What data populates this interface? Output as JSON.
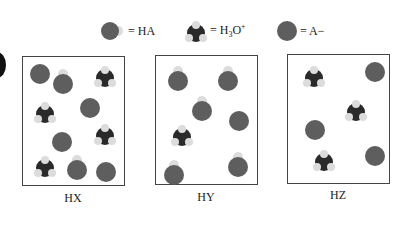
{
  "legend": [
    {
      "id": "ha",
      "icon": "ha-molecule-icon",
      "label": "= HA"
    },
    {
      "id": "h3o",
      "icon": "hydronium-molecule-icon",
      "label_parts": [
        "= H",
        "3",
        "O",
        "+"
      ]
    },
    {
      "id": "a",
      "icon": "anion-molecule-icon",
      "label": "= A−"
    }
  ],
  "colors": {
    "anion_sphere": "#5e5e5e",
    "hydrogen_sphere": "#dcdcdc",
    "oxygen_dark": "#2a2a2a",
    "box_border": "#444444"
  },
  "boxes": [
    {
      "label": "HX",
      "counts": {
        "HA": 2,
        "H3O+": 4,
        "A-": 4
      },
      "molecules": [
        {
          "type": "A",
          "x": 6,
          "y": 6
        },
        {
          "type": "HA",
          "x": 28,
          "y": 12
        },
        {
          "type": "H3O",
          "x": 70,
          "y": 8
        },
        {
          "type": "H3O",
          "x": 10,
          "y": 44
        },
        {
          "type": "A",
          "x": 56,
          "y": 40
        },
        {
          "type": "A",
          "x": 28,
          "y": 74
        },
        {
          "type": "H3O",
          "x": 70,
          "y": 66
        },
        {
          "type": "H3O",
          "x": 10,
          "y": 98
        },
        {
          "type": "HA",
          "x": 42,
          "y": 98
        },
        {
          "type": "A",
          "x": 72,
          "y": 104
        }
      ]
    },
    {
      "label": "HY",
      "counts": {
        "HA": 5,
        "H3O+": 1,
        "A-": 1
      },
      "molecules": [
        {
          "type": "HA",
          "x": 10,
          "y": 10
        },
        {
          "type": "HA",
          "x": 60,
          "y": 10
        },
        {
          "type": "HA",
          "x": 34,
          "y": 40
        },
        {
          "type": "A",
          "x": 72,
          "y": 54
        },
        {
          "type": "H3O",
          "x": 14,
          "y": 68
        },
        {
          "type": "HA",
          "x": 6,
          "y": 104
        },
        {
          "type": "HA",
          "x": 70,
          "y": 96
        }
      ]
    },
    {
      "label": "HZ",
      "counts": {
        "HA": 0,
        "H3O+": 3,
        "A-": 3
      },
      "molecules": [
        {
          "type": "H3O",
          "x": 14,
          "y": 10
        },
        {
          "type": "A",
          "x": 76,
          "y": 6
        },
        {
          "type": "H3O",
          "x": 56,
          "y": 44
        },
        {
          "type": "A",
          "x": 16,
          "y": 64
        },
        {
          "type": "H3O",
          "x": 24,
          "y": 94
        },
        {
          "type": "A",
          "x": 76,
          "y": 90
        }
      ]
    }
  ]
}
